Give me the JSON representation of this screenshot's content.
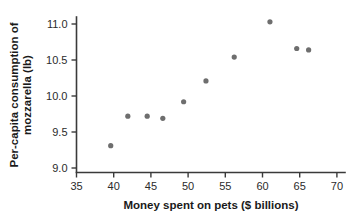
{
  "chart_data": {
    "type": "scatter",
    "title": "",
    "xlabel": "Money spent on pets ($ billions)",
    "ylabel": "Per-capita consumption of mozzarella (lb)",
    "ylabel_line1": "Per-capita consumption of",
    "ylabel_line2": "mozzarella (lb)",
    "xlim": [
      33.5,
      71.5
    ],
    "ylim": [
      8.85,
      11.25
    ],
    "xticks": [
      35,
      40,
      45,
      50,
      55,
      60,
      65,
      70
    ],
    "yticks": [
      9.0,
      9.5,
      10.0,
      10.5,
      11.0
    ],
    "xtick_labels": [
      "35",
      "40",
      "45",
      "50",
      "55",
      "60",
      "65",
      "70"
    ],
    "ytick_labels": [
      "9.0",
      "9.5",
      "10.0",
      "10.5",
      "11.0"
    ],
    "grid": false,
    "legend": null,
    "point_color": "#6e6e6e",
    "axis_color": "#3a3a3a",
    "points": [
      {
        "x": 39.6,
        "y": 9.31
      },
      {
        "x": 41.9,
        "y": 9.72
      },
      {
        "x": 44.5,
        "y": 9.72
      },
      {
        "x": 46.6,
        "y": 9.69
      },
      {
        "x": 49.4,
        "y": 9.92
      },
      {
        "x": 52.4,
        "y": 10.21
      },
      {
        "x": 56.2,
        "y": 10.54
      },
      {
        "x": 61.0,
        "y": 11.03
      },
      {
        "x": 64.6,
        "y": 10.66
      },
      {
        "x": 66.2,
        "y": 10.64
      }
    ]
  }
}
